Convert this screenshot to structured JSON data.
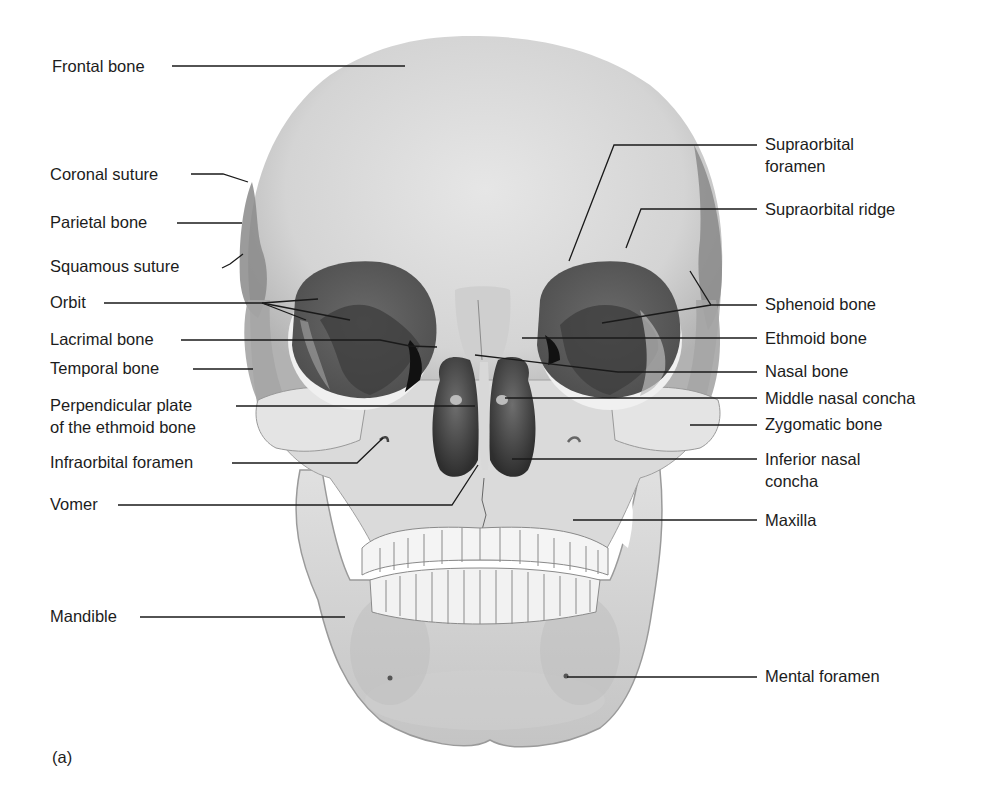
{
  "figure": {
    "tag": "(a)"
  },
  "labels_left": [
    {
      "id": "frontal-bone",
      "text": "Frontal bone",
      "x": 52,
      "y": 56
    },
    {
      "id": "coronal-suture",
      "text": "Coronal suture",
      "x": 50,
      "y": 164
    },
    {
      "id": "parietal-bone",
      "text": "Parietal bone",
      "x": 50,
      "y": 212
    },
    {
      "id": "squamous-suture",
      "text": "Squamous suture",
      "x": 50,
      "y": 256
    },
    {
      "id": "orbit",
      "text": "Orbit",
      "x": 50,
      "y": 292
    },
    {
      "id": "lacrimal-bone",
      "text": "Lacrimal bone",
      "x": 50,
      "y": 327
    },
    {
      "id": "temporal-bone",
      "text": "Temporal bone",
      "x": 50,
      "y": 358
    },
    {
      "id": "perpendicular-plate",
      "text": "Perpendicular plate",
      "text2": "of the ethmoid bone",
      "x": 50,
      "y": 395
    },
    {
      "id": "infraorbital-foramen",
      "text": "Infraorbital foramen",
      "x": 50,
      "y": 452
    },
    {
      "id": "vomer",
      "text": "Vomer",
      "x": 50,
      "y": 495
    },
    {
      "id": "mandible",
      "text": "Mandible",
      "x": 50,
      "y": 606
    }
  ],
  "labels_right": [
    {
      "id": "supraorbital-foramen",
      "text": "Supraorbital",
      "text2": "foramen",
      "x": 765,
      "y": 134
    },
    {
      "id": "supraorbital-ridge",
      "text": "Supraorbital ridge",
      "x": 765,
      "y": 199
    },
    {
      "id": "sphenoid-bone",
      "text": "Sphenoid bone",
      "x": 765,
      "y": 293
    },
    {
      "id": "ethmoid-bone",
      "text": "Ethmoid bone",
      "x": 765,
      "y": 328
    },
    {
      "id": "nasal-bone",
      "text": "Nasal bone",
      "x": 765,
      "y": 359
    },
    {
      "id": "middle-nasal-concha",
      "text": "Middle nasal concha",
      "x": 765,
      "y": 391
    },
    {
      "id": "zygomatic-bone",
      "text": "Zygomatic bone",
      "x": 765,
      "y": 416
    },
    {
      "id": "inferior-nasal-concha",
      "text": "Inferior nasal",
      "text2": "concha",
      "x": 765,
      "y": 450
    },
    {
      "id": "maxilla",
      "text": "Maxilla",
      "x": 765,
      "y": 510
    },
    {
      "id": "mental-foramen",
      "text": "Mental foramen",
      "x": 765,
      "y": 666
    }
  ],
  "colors": {
    "bone_light": "#e2e2e2",
    "bone_mid": "#bdbdbd",
    "bone_dark": "#7a7a7a",
    "cavity": "#5c5c5c",
    "deep_shadow": "#202020",
    "leader": "#1a1a1a",
    "text": "#1c1c1c"
  }
}
